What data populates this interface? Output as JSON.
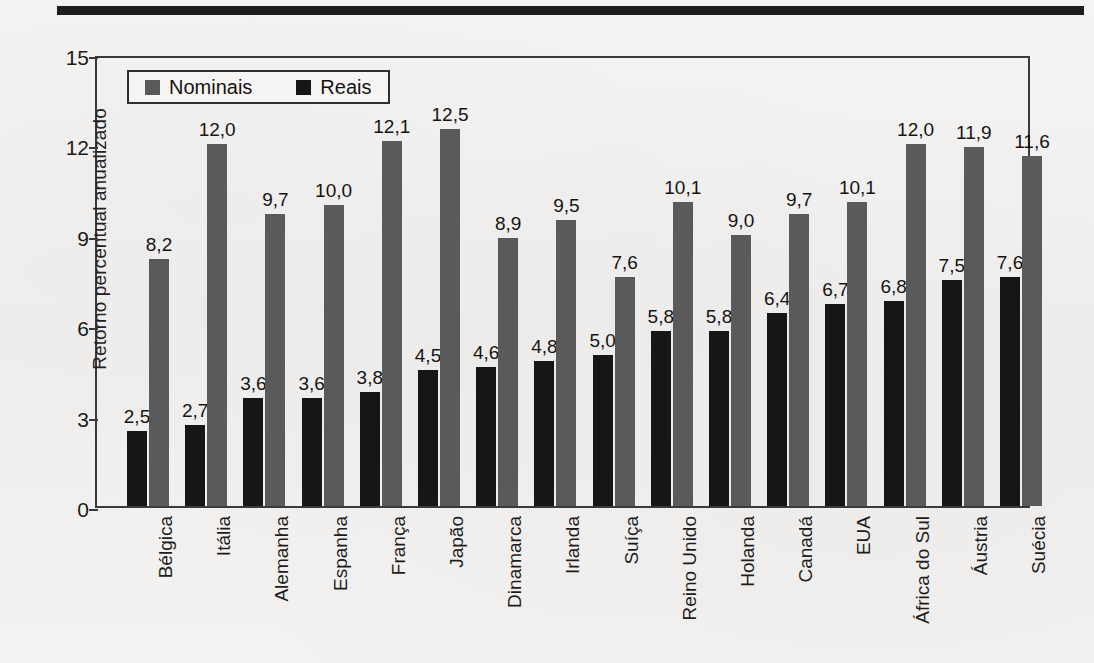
{
  "page": {
    "background_color": "#f4f2f0",
    "rule_color": "#1d1d1d"
  },
  "legend": {
    "items": [
      {
        "label": "Nominais",
        "color": "#5a5a5a"
      },
      {
        "label": "Reais",
        "color": "#161616"
      }
    ]
  },
  "chart_data": {
    "type": "bar",
    "title": "",
    "xlabel": "",
    "ylabel": "Retorno percentual anualizado",
    "ylim": [
      0,
      15
    ],
    "yticks": [
      0,
      3,
      6,
      9,
      12,
      15
    ],
    "ytick_labels": [
      "0",
      "3",
      "6",
      "9",
      "12",
      "15"
    ],
    "grid": false,
    "legend_position": "top-left",
    "decimal_separator": ",",
    "categories": [
      "Bélgica",
      "Itália",
      "Alemanha",
      "Espanha",
      "França",
      "Japão",
      "Dinamarca",
      "Irlanda",
      "Suíça",
      "Reino Unido",
      "Holanda",
      "Canadá",
      "EUA",
      "África do Sul",
      "Áustria",
      "Suécia"
    ],
    "series": [
      {
        "name": "Reais",
        "color": "#161616",
        "values": [
          2.5,
          2.7,
          3.6,
          3.6,
          3.8,
          4.5,
          4.6,
          4.8,
          5.0,
          5.8,
          5.8,
          6.4,
          6.7,
          6.8,
          7.5,
          7.6
        ],
        "labels": [
          "2,5",
          "2,7",
          "3,6",
          "3,6",
          "3,8",
          "4,5",
          "4,6",
          "4,8",
          "5,0",
          "5,8",
          "5,8",
          "6,4",
          "6,7",
          "6,8",
          "7,5",
          "7,6"
        ]
      },
      {
        "name": "Nominais",
        "color": "#5a5a5a",
        "values": [
          8.2,
          12.0,
          9.7,
          10.0,
          12.1,
          12.5,
          8.9,
          9.5,
          7.6,
          10.1,
          9.0,
          9.7,
          10.1,
          12.0,
          11.9,
          11.6
        ],
        "labels": [
          "8,2",
          "12,0",
          "9,7",
          "10,0",
          "12,1",
          "12,5",
          "8,9",
          "9,5",
          "7,6",
          "10,1",
          "9,0",
          "9,7",
          "10,1",
          "12,0",
          "11,9",
          "11,6"
        ]
      }
    ]
  }
}
